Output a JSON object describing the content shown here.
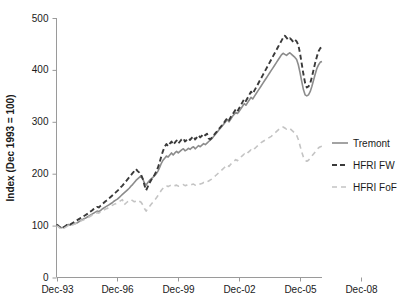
{
  "chart_data": {
    "type": "line",
    "title": "",
    "xlabel": "",
    "ylabel": "Index (Dec 1993 = 100)",
    "ylim": [
      0,
      500
    ],
    "yticks": [
      0,
      100,
      200,
      300,
      400,
      500
    ],
    "ytick_labels": [
      "0",
      "100",
      "200",
      "300",
      "400",
      "500"
    ],
    "xtick_labels": [
      "Dec-93",
      "Dec-96",
      "Dec-99",
      "Dec-02",
      "Dec-05",
      "Dec-08"
    ],
    "xlim": [
      "Dec-93",
      "Dec-09"
    ],
    "grid": false,
    "legend_position": "right",
    "x_start_year": 1993.917,
    "x_end_year": 2009.75,
    "series": [
      {
        "name": "Tremont",
        "style": "solid",
        "color": "#8c8c8c",
        "values": [
          100,
          99,
          97,
          96,
          97,
          99,
          101,
          102,
          101,
          102,
          103,
          104,
          105,
          107,
          109,
          111,
          113,
          114,
          116,
          118,
          120,
          122,
          124,
          126,
          128,
          127,
          129,
          132,
          134,
          136,
          138,
          140,
          142,
          144,
          147,
          149,
          151,
          154,
          157,
          160,
          163,
          166,
          169,
          172,
          176,
          179,
          183,
          187,
          190,
          193,
          196,
          190,
          182,
          178,
          183,
          187,
          190,
          193,
          196,
          200,
          205,
          212,
          220,
          226,
          230,
          234,
          232,
          236,
          240,
          236,
          240,
          243,
          240,
          243,
          246,
          248,
          244,
          246,
          249,
          247,
          250,
          252,
          248,
          251,
          254,
          252,
          255,
          258,
          256,
          259,
          262,
          265,
          268,
          272,
          276,
          280,
          284,
          288,
          292,
          296,
          300,
          304,
          300,
          305,
          310,
          314,
          318,
          316,
          320,
          325,
          330,
          335,
          332,
          337,
          342,
          347,
          344,
          349,
          354,
          359,
          364,
          369,
          374,
          379,
          384,
          389,
          394,
          399,
          404,
          409,
          414,
          419,
          424,
          429,
          432,
          430,
          428,
          431,
          433,
          430,
          427,
          424,
          420,
          410,
          395,
          378,
          362,
          352,
          350,
          352,
          358,
          368,
          380,
          392,
          403,
          410,
          415,
          416
        ]
      },
      {
        "name": "HFRI FW",
        "style": "dashed",
        "color": "#3a3a3a",
        "values": [
          102,
          100,
          97,
          95,
          96,
          98,
          101,
          103,
          102,
          104,
          106,
          108,
          110,
          112,
          114,
          116,
          118,
          120,
          122,
          125,
          127,
          129,
          132,
          134,
          136,
          135,
          138,
          141,
          144,
          147,
          149,
          152,
          155,
          158,
          161,
          164,
          167,
          170,
          174,
          177,
          181,
          185,
          189,
          193,
          197,
          201,
          205,
          209,
          205,
          202,
          198,
          190,
          178,
          168,
          175,
          182,
          188,
          193,
          198,
          204,
          212,
          222,
          234,
          244,
          252,
          257,
          253,
          258,
          262,
          256,
          260,
          264,
          258,
          262,
          266,
          268,
          262,
          265,
          268,
          265,
          269,
          272,
          266,
          270,
          274,
          270,
          273,
          277,
          274,
          277,
          268,
          266,
          270,
          274,
          278,
          282,
          286,
          290,
          294,
          298,
          303,
          307,
          303,
          309,
          314,
          319,
          324,
          320,
          326,
          332,
          338,
          344,
          340,
          346,
          352,
          358,
          354,
          360,
          366,
          372,
          378,
          384,
          390,
          396,
          402,
          408,
          414,
          420,
          426,
          432,
          438,
          444,
          450,
          456,
          462,
          466,
          462,
          458,
          461,
          458,
          454,
          458,
          455,
          448,
          432,
          412,
          392,
          375,
          366,
          368,
          374,
          386,
          400,
          414,
          426,
          436,
          442,
          444
        ]
      },
      {
        "name": "HFRI FoF",
        "style": "dashed-light",
        "color": "#c4c4c4",
        "values": [
          100,
          98,
          95,
          93,
          94,
          96,
          98,
          100,
          99,
          100,
          102,
          103,
          105,
          106,
          108,
          110,
          111,
          113,
          115,
          116,
          118,
          120,
          122,
          123,
          125,
          124,
          126,
          128,
          130,
          132,
          133,
          135,
          137,
          139,
          141,
          142,
          144,
          146,
          148,
          150,
          140,
          143,
          146,
          148,
          150,
          148,
          146,
          147,
          149,
          147,
          145,
          140,
          133,
          128,
          133,
          137,
          141,
          145,
          149,
          153,
          158,
          163,
          168,
          172,
          175,
          177,
          175,
          177,
          178,
          176,
          177,
          178,
          176,
          177,
          178,
          179,
          177,
          178,
          179,
          178,
          179,
          180,
          178,
          180,
          181,
          180,
          181,
          183,
          182,
          184,
          186,
          188,
          190,
          193,
          196,
          199,
          202,
          205,
          208,
          211,
          214,
          217,
          214,
          218,
          221,
          224,
          227,
          225,
          228,
          232,
          235,
          238,
          236,
          240,
          243,
          246,
          244,
          248,
          251,
          254,
          257,
          260,
          262,
          264,
          266,
          268,
          270,
          272,
          275,
          278,
          281,
          284,
          287,
          289,
          290,
          288,
          286,
          288,
          287,
          284,
          281,
          278,
          274,
          266,
          254,
          242,
          232,
          226,
          224,
          226,
          230,
          234,
          238,
          242,
          246,
          250,
          252,
          253
        ]
      }
    ]
  },
  "legend": {
    "items": [
      {
        "label": "Tremont",
        "key": "tremont"
      },
      {
        "label": "HFRI FW",
        "key": "hfri-fw"
      },
      {
        "label": "HFRI FoF",
        "key": "hfri-fof"
      }
    ]
  },
  "colors": {
    "tremont": "#8c8c8c",
    "hfri_fw": "#3a3a3a",
    "hfri_fof": "#c4c4c4",
    "axis": "#9a9a9a",
    "text": "#1a1a1a",
    "background": "#ffffff"
  }
}
